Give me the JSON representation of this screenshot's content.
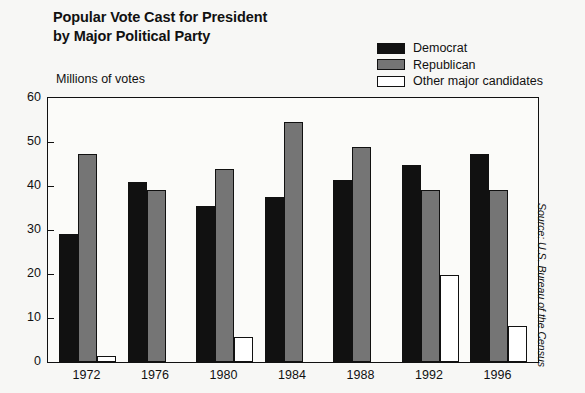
{
  "title": "Popular Vote Cast for President\nby Major Political Party",
  "axis_caption": "Millions of votes",
  "source_note": "Source: U.S. Bureau of the Census",
  "legend": {
    "items": [
      {
        "label": "Democrat",
        "color": "#111111",
        "swatch_icon": "filled-black-square-icon"
      },
      {
        "label": "Republican",
        "color": "#757575",
        "swatch_icon": "filled-gray-square-icon"
      },
      {
        "label": "Other major candidates",
        "color": "#ffffff",
        "swatch_icon": "empty-white-square-icon"
      }
    ]
  },
  "chart_data": {
    "type": "bar",
    "title": "Popular Vote Cast for President by Major Political Party",
    "xlabel": "",
    "ylabel": "Millions of votes",
    "ylim": [
      0,
      60
    ],
    "yticks": [
      0,
      10,
      20,
      30,
      40,
      50,
      60
    ],
    "ytick_labels": [
      "0",
      "10",
      "20",
      "30",
      "40",
      "50",
      "60"
    ],
    "grid": false,
    "legend_position": "top-right",
    "categories": [
      "1972",
      "1976",
      "1980",
      "1984",
      "1988",
      "1992",
      "1996"
    ],
    "series": [
      {
        "name": "Democrat",
        "color": "#111111",
        "values": [
          29.2,
          40.8,
          35.5,
          37.6,
          41.3,
          44.8,
          47.3
        ]
      },
      {
        "name": "Republican",
        "color": "#757575",
        "values": [
          47.2,
          39.1,
          43.9,
          54.5,
          48.8,
          39.1,
          39.2
        ]
      },
      {
        "name": "Other major candidates",
        "color": "#ffffff",
        "values": [
          1.4,
          0,
          5.7,
          0,
          0,
          19.7,
          8.2
        ]
      }
    ],
    "source": "Source: U.S. Bureau of the Census"
  }
}
